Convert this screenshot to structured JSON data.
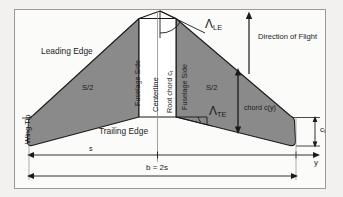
{
  "diagram": {
    "frame": {
      "border_color": "#9a9a9a",
      "background": "#fbfbfa"
    },
    "colors": {
      "wing_fill": "#8a8a8a",
      "wing_stroke": "#1a1a1a",
      "fuselage_fill": "#ffffff",
      "line": "#1a1a1a",
      "page_background": "#f2f1ef"
    },
    "labels": {
      "leading_edge": "Leading Edge",
      "trailing_edge": "Trailing Edge",
      "wing_tip": "Wing Tip",
      "centerline": "Centerline",
      "root_chord": "Root  chord c",
      "root_chord_sub": "r",
      "fuselage_side_left": "Fuselage Side",
      "fuselage_side_right": "Fuselage Side",
      "area_left": "S/2",
      "area_right": "S/2",
      "direction_of_flight": "Direction of Flight",
      "sweep_le": "Λ",
      "sweep_le_sub": "LE",
      "sweep_te": "Λ",
      "sweep_te_sub": "TE",
      "chord_y": "chord c(y)",
      "tip_chord": "c",
      "tip_chord_sub": "t",
      "semi_span": "s",
      "span": "b = 2s",
      "spanwise_axis": "y"
    }
  }
}
